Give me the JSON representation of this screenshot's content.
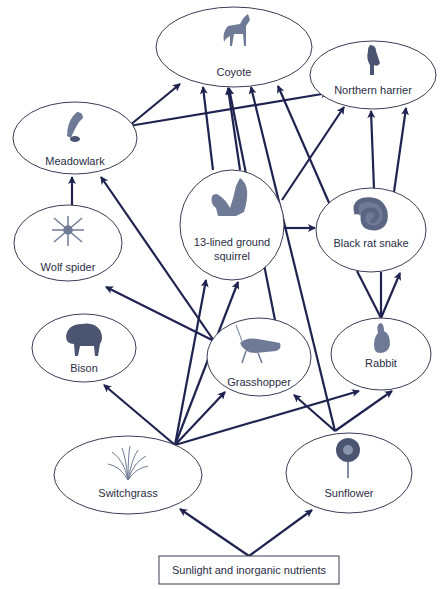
{
  "source": {
    "label": "Sunlight and inorganic nutrients"
  },
  "nodes": [
    {
      "id": "coyote",
      "label": "Coyote",
      "icon": "coyote-icon"
    },
    {
      "id": "harrier",
      "label": "Northern harrier",
      "icon": "hawk-icon"
    },
    {
      "id": "meadowlark",
      "label": "Meadowlark",
      "icon": "songbird-icon"
    },
    {
      "id": "squirrel",
      "label_line1": "13-lined ground",
      "label_line2": "squirrel",
      "icon": "squirrel-icon"
    },
    {
      "id": "snake",
      "label": "Black rat snake",
      "icon": "snake-icon"
    },
    {
      "id": "spider",
      "label": "Wolf spider",
      "icon": "spider-icon"
    },
    {
      "id": "bison",
      "label": "Bison",
      "icon": "bison-icon"
    },
    {
      "id": "grasshopper",
      "label": "Grasshopper",
      "icon": "grasshopper-icon"
    },
    {
      "id": "rabbit",
      "label": "Rabbit",
      "icon": "rabbit-icon"
    },
    {
      "id": "switchgrass",
      "label": "Switchgrass",
      "icon": "grass-icon"
    },
    {
      "id": "sunflower",
      "label": "Sunflower",
      "icon": "sunflower-icon"
    }
  ],
  "edges": [
    {
      "from": "source",
      "to": "switchgrass"
    },
    {
      "from": "source",
      "to": "sunflower"
    },
    {
      "from": "switchgrass",
      "to": "bison"
    },
    {
      "from": "switchgrass",
      "to": "squirrel"
    },
    {
      "from": "switchgrass",
      "to": "grasshopper"
    },
    {
      "from": "switchgrass",
      "to": "rabbit"
    },
    {
      "from": "sunflower",
      "to": "grasshopper"
    },
    {
      "from": "sunflower",
      "to": "rabbit"
    },
    {
      "from": "sunflower",
      "to": "squirrel"
    },
    {
      "from": "grasshopper",
      "to": "spider"
    },
    {
      "from": "grasshopper",
      "to": "meadowlark"
    },
    {
      "from": "grasshopper",
      "to": "squirrel"
    },
    {
      "from": "grasshopper",
      "to": "coyote"
    },
    {
      "from": "spider",
      "to": "meadowlark"
    },
    {
      "from": "meadowlark",
      "to": "coyote"
    },
    {
      "from": "meadowlark",
      "to": "harrier"
    },
    {
      "from": "squirrel",
      "to": "coyote"
    },
    {
      "from": "squirrel",
      "to": "snake"
    },
    {
      "from": "squirrel",
      "to": "harrier"
    },
    {
      "from": "snake",
      "to": "coyote"
    },
    {
      "from": "snake",
      "to": "harrier"
    },
    {
      "from": "rabbit",
      "to": "snake"
    },
    {
      "from": "rabbit",
      "to": "coyote"
    },
    {
      "from": "rabbit",
      "to": "harrier"
    },
    {
      "from": "sunflower",
      "to": "coyote"
    }
  ]
}
